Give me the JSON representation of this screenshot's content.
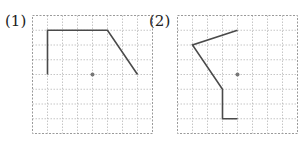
{
  "figures": [
    {
      "label": "(1)",
      "grid": {
        "cols": 8,
        "rows": 8
      },
      "center_point": [
        4,
        4
      ],
      "polyline": [
        [
          1,
          4
        ],
        [
          1,
          1
        ],
        [
          5,
          1
        ],
        [
          7,
          4
        ]
      ]
    },
    {
      "label": "(2)",
      "grid": {
        "cols": 8,
        "rows": 8
      },
      "center_point": [
        4,
        4
      ],
      "polyline": [
        [
          4,
          1
        ],
        [
          1,
          2
        ],
        [
          3,
          5
        ],
        [
          3,
          7
        ],
        [
          4,
          7
        ]
      ]
    }
  ],
  "colors": {
    "grid_line": "#b8b8b8",
    "border": "#9a9a9a",
    "shape": "#4a4a4a",
    "center_dot": "#777777"
  }
}
